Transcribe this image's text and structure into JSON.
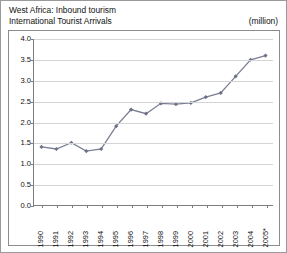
{
  "header": {
    "title_line1": "West Africa: Inbound tourism",
    "title_line2": "International Tourist Arrivals",
    "unit": "(million)"
  },
  "colors": {
    "line": "#7b7f93",
    "marker": "#6d7188",
    "grid": "#d4d4d4",
    "axis": "#7d7d7d",
    "border": "#8c8c8c",
    "text": "#111111"
  },
  "chart_data": {
    "type": "line",
    "xlabel": "",
    "ylabel": "",
    "unit": "million",
    "grid": true,
    "legend": "none",
    "ylim": [
      0.0,
      4.0
    ],
    "yticks": [
      "0.0",
      "0.5",
      "1.0",
      "1.5",
      "2.0",
      "2.5",
      "3.0",
      "3.5",
      "4.0"
    ],
    "categories": [
      "1990",
      "1991",
      "1992",
      "1993",
      "1994",
      "1995",
      "1996",
      "1997",
      "1998",
      "1999",
      "2000",
      "2001",
      "2002",
      "2003",
      "2004",
      "2005*"
    ],
    "values": [
      1.4,
      1.35,
      1.5,
      1.3,
      1.35,
      1.9,
      2.3,
      2.2,
      2.45,
      2.43,
      2.46,
      2.6,
      2.7,
      3.1,
      3.5,
      3.6
    ]
  }
}
